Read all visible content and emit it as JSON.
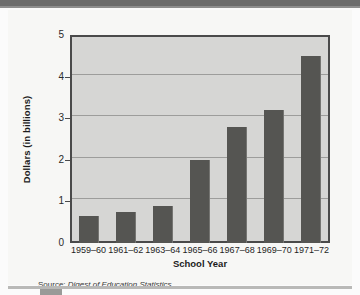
{
  "chart_data": {
    "type": "bar",
    "title": "",
    "xlabel": "School Year",
    "ylabel": "Dollars (in billions)",
    "categories": [
      "1959–60",
      "1961–62",
      "1963–64",
      "1965–66",
      "1967–68",
      "1969–70",
      "1971–72"
    ],
    "values": [
      0.65,
      0.75,
      0.9,
      2.0,
      2.8,
      3.2,
      4.5
    ],
    "ylim": [
      0,
      5
    ],
    "y_ticks": [
      "0",
      "1",
      "2",
      "3",
      "4",
      "5"
    ],
    "grid": true,
    "legend": "none",
    "bar_color": "#555552",
    "plot_background": "#d6d6d4"
  },
  "source": {
    "prefix": "Source:",
    "title": "Digest of Education Statistics"
  }
}
